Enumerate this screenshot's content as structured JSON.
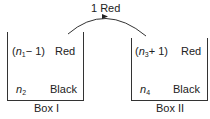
{
  "transfer": {
    "label": "1 Red",
    "direction": "Box I to Box II"
  },
  "boxes": [
    {
      "label": "Box I",
      "rows": [
        {
          "count_prefix": "(",
          "var": "n",
          "sub": "1",
          "count_suffix": "− 1)",
          "color": "Red"
        },
        {
          "count_prefix": "",
          "var": "n",
          "sub": "2",
          "count_suffix": "",
          "color": "Black"
        }
      ]
    },
    {
      "label": "Box II",
      "rows": [
        {
          "count_prefix": "(",
          "var": "n",
          "sub": "3",
          "count_suffix": "+ 1)",
          "color": "Red"
        },
        {
          "count_prefix": "",
          "var": "n",
          "sub": "4",
          "count_suffix": "",
          "color": "Black"
        }
      ]
    }
  ]
}
